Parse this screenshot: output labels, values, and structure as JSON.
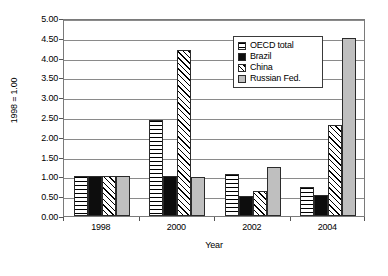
{
  "chart_data": {
    "type": "bar",
    "title": "",
    "subtitle": "",
    "xlabel": "Year",
    "ylabel": "1998 = 1.00",
    "categories": [
      "1998",
      "2000",
      "2002",
      "2004"
    ],
    "series": [
      {
        "name": "OECD total",
        "values": [
          1.0,
          2.42,
          1.05,
          0.74
        ],
        "fill": "horizontal-lines",
        "color": "#ffffff"
      },
      {
        "name": "Brazil",
        "values": [
          1.0,
          1.01,
          0.5,
          0.54
        ],
        "fill": "solid",
        "color": "#0d0d0d"
      },
      {
        "name": "China",
        "values": [
          1.0,
          4.2,
          0.63,
          2.29
        ],
        "fill": "diagonal-hatch",
        "color": "#ffffff"
      },
      {
        "name": "Russian Fed.",
        "values": [
          1.0,
          0.98,
          1.23,
          4.5
        ],
        "fill": "solid",
        "color": "#bfbfbf"
      }
    ],
    "ylim": [
      0,
      5
    ],
    "ytick_step": 0.5,
    "yticks": [
      "0.00",
      "0.50",
      "1.00",
      "1.50",
      "2.00",
      "2.50",
      "3.00",
      "3.50",
      "4.00",
      "4.50",
      "5.00"
    ],
    "grid": true,
    "grid_axis": "y",
    "legend_position": "upper-right-inside",
    "legend_entries": [
      "OECD total",
      "Brazil",
      "China",
      "Russian Fed."
    ]
  },
  "axes": {
    "y_title": "1998 = 1.00",
    "x_title": "Year"
  }
}
